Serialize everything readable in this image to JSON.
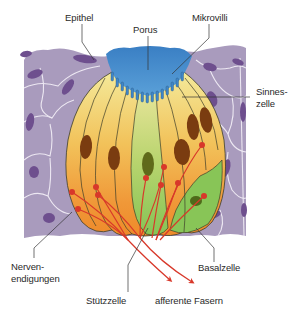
{
  "labels": {
    "epithel": "Epithel",
    "porus": "Porus",
    "mikrovilli": "Mikrovilli",
    "sinneszelle_1": "Sinnes-",
    "sinneszelle_2": "zelle",
    "nervenendigungen_1": "Nerven-",
    "nervenendigungen_2": "endigungen",
    "stuetzzelle": "Stützzelle",
    "afferente_fasern": "afferente Fasern",
    "basalzelle": "Basalzelle"
  },
  "colors": {
    "epithelium": "#a99bbd",
    "epithelium_nucleus": "#6e4f8e",
    "cell_border": "#f2eef7",
    "porus": "#3f86c8",
    "sensory_top": "#f3e79a",
    "sensory_mid": "#f2b64c",
    "sensory_bottom": "#f08a2c",
    "support_cell": "#8cc65a",
    "nucleus_brown": "#7a3c10",
    "nerve": "#d8382a",
    "outline": "#3d3d2a",
    "leader_line": "#333333"
  }
}
